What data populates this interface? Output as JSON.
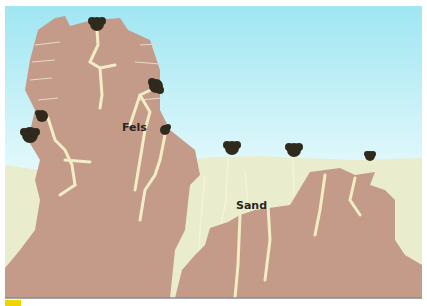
{
  "diagram": {
    "labels": {
      "rock": "Fels",
      "sand": "Sand"
    },
    "colors": {
      "sky_top": "#9fe6f2",
      "sky_bottom": "#ffffff",
      "rock": "#c49a88",
      "sand": "#eaedcd",
      "roots": "#f1edc6",
      "plant": "#2f2a1c",
      "frame_line": "#8a8a94",
      "corner_mark": "#f0d400"
    },
    "elements": [
      {
        "type": "rock-pillar",
        "label": "Fels"
      },
      {
        "type": "sand-ground",
        "label": "Sand"
      },
      {
        "type": "rock-formation-buried"
      },
      {
        "type": "plant",
        "count": 8
      }
    ]
  }
}
